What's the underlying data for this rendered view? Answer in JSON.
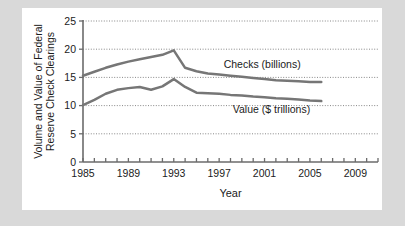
{
  "chart_data": {
    "type": "line",
    "title": "",
    "xlabel": "Year",
    "ylabel": "Volume and Value of Federal Reserve Check Clearings",
    "ylabel_line1": "Volume and Value of Federal",
    "ylabel_line2": "Reserve Check Clearings",
    "xlim": [
      1985,
      2011
    ],
    "ylim": [
      0,
      25
    ],
    "y_ticks": [
      0,
      5,
      10,
      15,
      20,
      25
    ],
    "y_tick_labels": [
      "0",
      "5",
      "10",
      "15",
      "20",
      "25"
    ],
    "x_ticks": [
      1985,
      1986,
      1987,
      1988,
      1989,
      1990,
      1991,
      1992,
      1993,
      1994,
      1995,
      1996,
      1997,
      1998,
      1999,
      2000,
      2001,
      2002,
      2003,
      2004,
      2005,
      2006,
      2007,
      2008,
      2009,
      2010,
      2011
    ],
    "x_tick_labels_shown": [
      "1985",
      "1989",
      "1993",
      "1997",
      "2001",
      "2005",
      "2009"
    ],
    "x_labeled_ticks": [
      1985,
      1989,
      1993,
      1997,
      2001,
      2005,
      2009
    ],
    "grid": "horizontal-dotted",
    "legend_position": "inline-annotations",
    "line_color": "#767676",
    "axis_color": "#6b6b6b",
    "background_color": "#ffffff",
    "page_background_color": "#d9d9d9",
    "series": [
      {
        "name": "Checks (billions)",
        "label_x": 1997.4,
        "label_y": 16.6,
        "x": [
          1985,
          1986,
          1987,
          1988,
          1989,
          1990,
          1991,
          1992,
          1993,
          1994,
          1995,
          1996,
          1997,
          1998,
          1999,
          2000,
          2001,
          2002,
          2003,
          2004,
          2005,
          2006
        ],
        "values": [
          15.3,
          16.0,
          16.7,
          17.3,
          17.8,
          18.2,
          18.6,
          19.0,
          19.8,
          16.7,
          16.1,
          15.7,
          15.5,
          15.3,
          15.1,
          14.9,
          14.7,
          14.5,
          14.4,
          14.3,
          14.2,
          14.2
        ]
      },
      {
        "name": "Value ($ trillions)",
        "label_x": 1998.2,
        "label_y": 8.6,
        "x": [
          1985,
          1986,
          1987,
          1988,
          1989,
          1990,
          1991,
          1992,
          1993,
          1994,
          1995,
          1996,
          1997,
          1998,
          1999,
          2000,
          2001,
          2002,
          2003,
          2004,
          2005,
          2006
        ],
        "values": [
          10.1,
          11.0,
          12.1,
          12.8,
          13.1,
          13.3,
          12.8,
          13.4,
          14.7,
          13.3,
          12.3,
          12.2,
          12.1,
          11.9,
          11.8,
          11.6,
          11.5,
          11.3,
          11.2,
          11.1,
          10.9,
          10.8
        ]
      }
    ]
  }
}
